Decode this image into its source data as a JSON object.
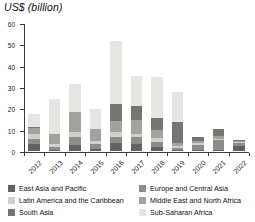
{
  "chart_data": {
    "type": "bar",
    "stacked": true,
    "title": "US$ (billion)",
    "xlabel": "",
    "ylabel": "",
    "ylim": [
      0,
      60
    ],
    "yticks": [
      0,
      10,
      20,
      30,
      40,
      50,
      60
    ],
    "grid": false,
    "legend_position": "bottom",
    "categories": [
      "2012",
      "2013",
      "2014",
      "2015",
      "2016",
      "2017",
      "2018",
      "2019",
      "2020",
      "2021",
      "2022"
    ],
    "series": [
      {
        "name": "East Asia and Pacific",
        "color": "#63625f",
        "values": [
          3.2,
          0.6,
          2.6,
          1.1,
          3.9,
          3.5,
          2.0,
          0.5,
          0.4,
          0.5,
          2.4
        ]
      },
      {
        "name": "Europe and Central Asia",
        "color": "#8d8c89",
        "values": [
          2.6,
          1.1,
          4.0,
          2.2,
          2.9,
          3.1,
          2.4,
          1.0,
          2.6,
          4.6,
          1.3
        ]
      },
      {
        "name": "Latin America and the Caribbean",
        "color": "#d0cfcb",
        "values": [
          2.0,
          1.6,
          2.2,
          1.4,
          2.0,
          1.5,
          1.5,
          0.9,
          0.7,
          0.6,
          0.5
        ]
      },
      {
        "name": "Middle East and North Africa",
        "color": "#a3a29e",
        "values": [
          3.1,
          4.7,
          9.5,
          5.4,
          5.4,
          6.5,
          3.9,
          1.4,
          1.2,
          1.3,
          0.6
        ]
      },
      {
        "name": "South Asia",
        "color": "#767572",
        "values": [
          0.6,
          0.2,
          0.2,
          0.2,
          7.9,
          6.5,
          5.7,
          9.9,
          1.9,
          3.5,
          0.6
        ]
      },
      {
        "name": "Sub-Saharan Africa",
        "color": "#e6e5e1",
        "values": [
          5.8,
          16.0,
          13.1,
          9.5,
          29.7,
          14.1,
          19.2,
          13.9,
          0.0,
          0.0,
          0.0
        ]
      }
    ],
    "totals": [
      17.3,
      24.2,
      31.6,
      19.8,
      51.8,
      35.2,
      34.7,
      27.6,
      6.8,
      10.5,
      5.4
    ]
  }
}
